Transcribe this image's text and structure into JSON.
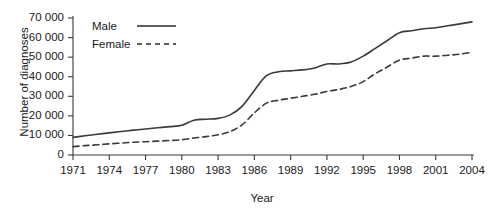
{
  "chart_data": {
    "type": "line",
    "title": "",
    "xlabel": "Year",
    "ylabel": "Number of diagnoses",
    "xlim": [
      1971,
      2004
    ],
    "ylim": [
      0,
      70000
    ],
    "grid": false,
    "legend_position": "top-left-inside",
    "xticks": [
      "1971",
      "1974",
      "1977",
      "1980",
      "1983",
      "1986",
      "1989",
      "1992",
      "1995",
      "1998",
      "2001",
      "2004"
    ],
    "xtick_values": [
      1971,
      1974,
      1977,
      1980,
      1983,
      1986,
      1989,
      1992,
      1995,
      1998,
      2001,
      2004
    ],
    "yticks": [
      "0",
      "10 000",
      "20 000",
      "30 000",
      "40 000",
      "50 000",
      "60 000",
      "70 000"
    ],
    "ytick_values": [
      0,
      10000,
      20000,
      30000,
      40000,
      50000,
      60000,
      70000
    ],
    "x": [
      1971,
      1972,
      1973,
      1974,
      1975,
      1976,
      1977,
      1978,
      1979,
      1980,
      1981,
      1982,
      1983,
      1984,
      1985,
      1986,
      1987,
      1988,
      1989,
      1990,
      1991,
      1992,
      1993,
      1994,
      1995,
      1996,
      1997,
      1998,
      1999,
      2000,
      2001,
      2002,
      2003,
      2004
    ],
    "series": [
      {
        "name": "Male",
        "style": "solid",
        "color": "#3a3a3a",
        "values": [
          9000,
          9800,
          10600,
          11300,
          12000,
          12700,
          13300,
          13900,
          14500,
          15200,
          17800,
          18300,
          18700,
          20500,
          25000,
          33000,
          40500,
          42500,
          43000,
          43500,
          44500,
          46500,
          46500,
          47500,
          50500,
          54500,
          58500,
          62500,
          63500,
          64500,
          65000,
          66000,
          67000,
          68000
        ]
      },
      {
        "name": "Female",
        "style": "dashed",
        "color": "#3a3a3a",
        "values": [
          4300,
          4800,
          5200,
          5700,
          6100,
          6500,
          6800,
          7100,
          7400,
          7800,
          8700,
          9400,
          10300,
          12000,
          15500,
          21500,
          26500,
          28000,
          29000,
          30000,
          31000,
          32500,
          33500,
          35000,
          37500,
          41500,
          45000,
          48500,
          49500,
          50500,
          50500,
          51000,
          51500,
          52500
        ]
      }
    ]
  },
  "legend": {
    "items": [
      {
        "label": "Male",
        "style": "solid"
      },
      {
        "label": "Female",
        "style": "dashed"
      }
    ]
  }
}
